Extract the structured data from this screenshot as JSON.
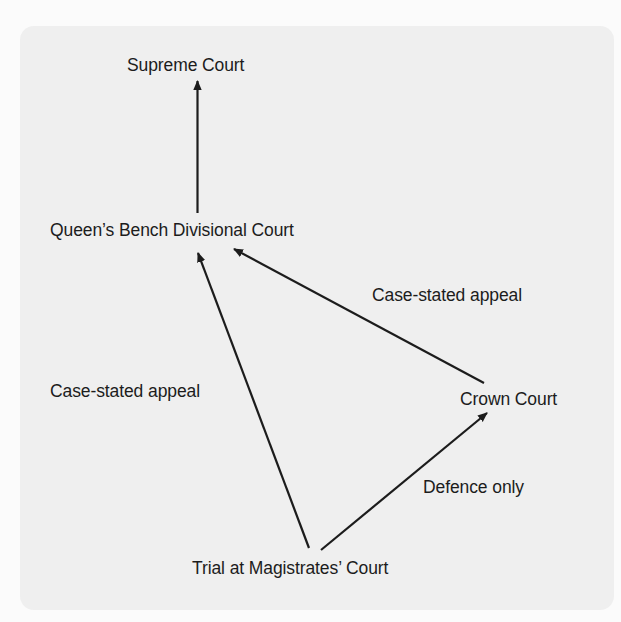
{
  "diagram": {
    "type": "flow",
    "nodes": [
      {
        "id": "supreme",
        "label": "Supreme Court"
      },
      {
        "id": "qbd",
        "label": "Queen’s Bench Divisional Court"
      },
      {
        "id": "crown",
        "label": "Crown Court"
      },
      {
        "id": "magistrates",
        "label": "Trial at Magistrates’ Court"
      }
    ],
    "edges": [
      {
        "from": "qbd",
        "to": "supreme",
        "label": ""
      },
      {
        "from": "magistrates",
        "to": "qbd",
        "label": "Case-stated appeal"
      },
      {
        "from": "crown",
        "to": "qbd",
        "label": "Case-stated appeal"
      },
      {
        "from": "magistrates",
        "to": "crown",
        "label": "Defence only"
      }
    ]
  },
  "colors": {
    "page_background": "#fbfbfb",
    "panel_background": "#efefef",
    "line_and_text": "#1c1c1c"
  }
}
